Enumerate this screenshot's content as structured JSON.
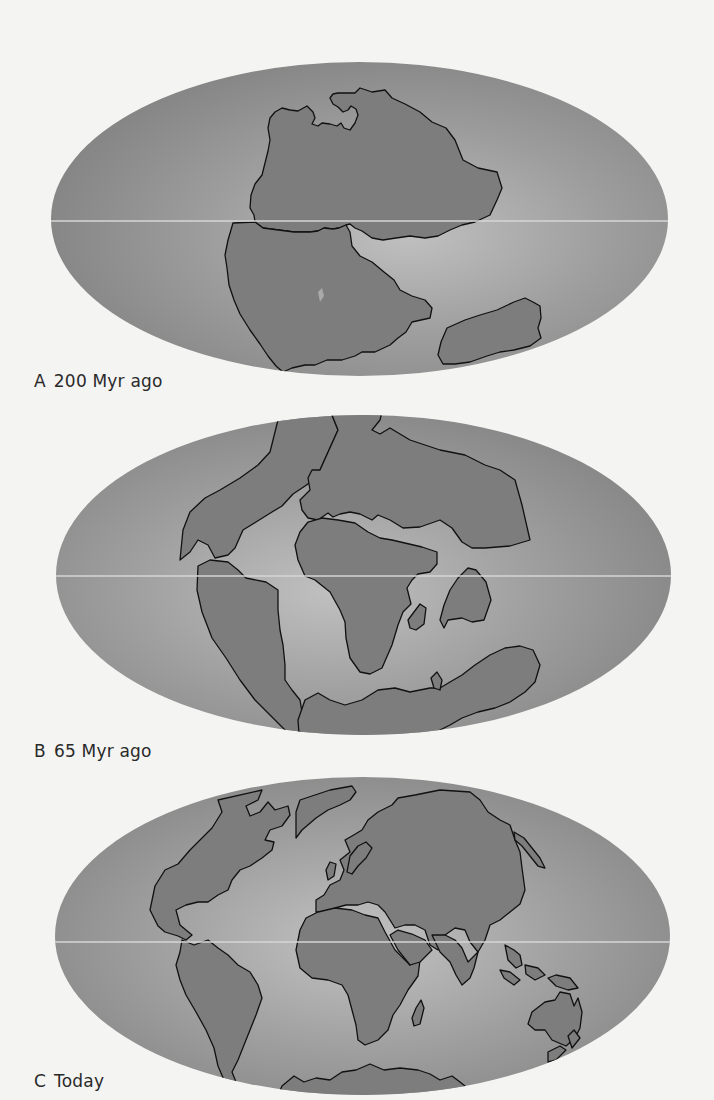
{
  "figure": {
    "panels": [
      {
        "letter": "A",
        "label": "200 Myr ago",
        "caption_full": "A 200 Myr ago",
        "era": "Pangaea"
      },
      {
        "letter": "B",
        "label": "65 Myr ago",
        "caption_full": "B 65 Myr ago",
        "era": "Late Cretaceous"
      },
      {
        "letter": "C",
        "label": "Today",
        "caption_full": "C Today",
        "era": "Present"
      }
    ],
    "projection": "Mollweide (equal-area ellipse)",
    "features": [
      "equator-line",
      "continent-outlines"
    ]
  },
  "colors": {
    "page_background": "#f4f4f2",
    "ocean_edge": "#858585",
    "ocean_center": "#bdbdbd",
    "land_fill": "#7d7d7d",
    "coastline": "#111111",
    "equator": "#d6d6d6",
    "caption_text": "#2a2a2a"
  }
}
